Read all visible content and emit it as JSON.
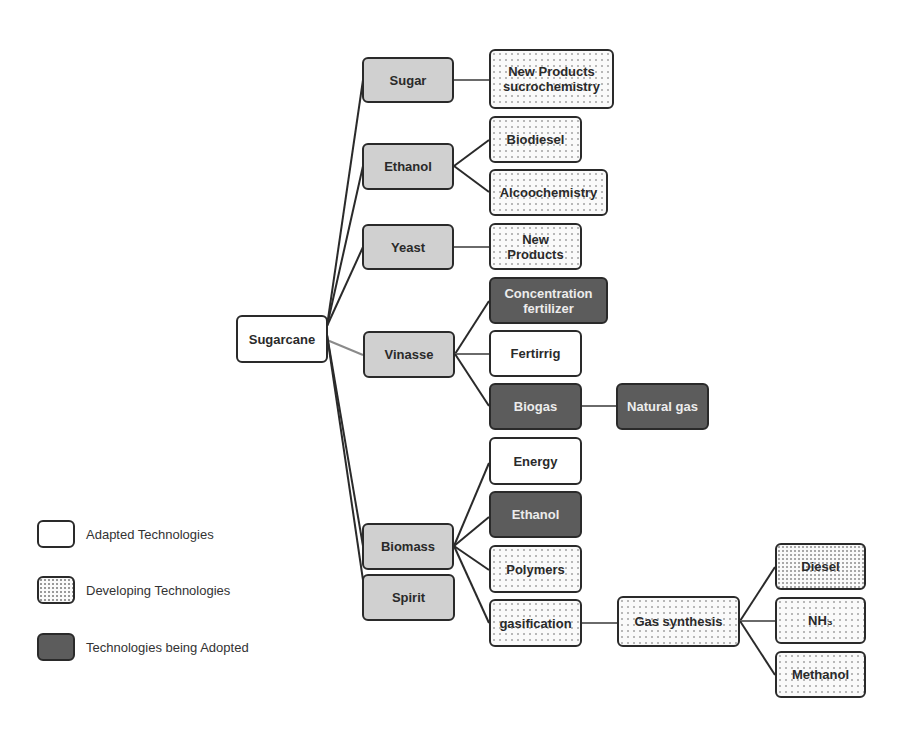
{
  "diagram": {
    "root": {
      "id": "sugarcane",
      "label": "Sugarcane"
    },
    "nodes": [
      {
        "id": "sugarcane",
        "label": "Sugarcane",
        "type": "adapted",
        "x": 236,
        "y": 315,
        "w": 92,
        "h": 48
      },
      {
        "id": "sugar",
        "label": "Sugar",
        "type": "category",
        "x": 362,
        "y": 57,
        "w": 92,
        "h": 46
      },
      {
        "id": "ethanol",
        "label": "Ethanol",
        "type": "category",
        "x": 362,
        "y": 143,
        "w": 92,
        "h": 47
      },
      {
        "id": "yeast",
        "label": "Yeast",
        "type": "category",
        "x": 362,
        "y": 224,
        "w": 92,
        "h": 46
      },
      {
        "id": "vinasse",
        "label": "Vinasse",
        "type": "category",
        "x": 363,
        "y": 331,
        "w": 92,
        "h": 47
      },
      {
        "id": "biomass",
        "label": "Biomass",
        "type": "category",
        "x": 362,
        "y": 523,
        "w": 92,
        "h": 47
      },
      {
        "id": "spirit",
        "label": "Spirit",
        "type": "category",
        "x": 362,
        "y": 574,
        "w": 93,
        "h": 47
      },
      {
        "id": "new-products-sucrochemistry",
        "label": "New Products\nsucrochemistry",
        "type": "developing",
        "x": 489,
        "y": 49,
        "w": 125,
        "h": 60
      },
      {
        "id": "biodiesel",
        "label": "Biodiesel",
        "type": "developing",
        "x": 489,
        "y": 116,
        "w": 93,
        "h": 47
      },
      {
        "id": "alcoochemistry",
        "label": "Alcoochemistry",
        "type": "developing",
        "x": 489,
        "y": 169,
        "w": 119,
        "h": 47
      },
      {
        "id": "new-products",
        "label": "New\nProducts",
        "type": "developing",
        "x": 489,
        "y": 223,
        "w": 93,
        "h": 47
      },
      {
        "id": "concentration-fertilizer",
        "label": "Concentration\nfertilizer",
        "type": "adopting",
        "x": 489,
        "y": 277,
        "w": 119,
        "h": 47
      },
      {
        "id": "fertirrig",
        "label": "Fertirrig",
        "type": "adapted",
        "x": 489,
        "y": 330,
        "w": 93,
        "h": 47
      },
      {
        "id": "biogas",
        "label": "Biogas",
        "type": "adopting",
        "x": 489,
        "y": 383,
        "w": 93,
        "h": 47
      },
      {
        "id": "natural-gas",
        "label": "Natural gas",
        "type": "adopting",
        "x": 616,
        "y": 383,
        "w": 93,
        "h": 47
      },
      {
        "id": "energy",
        "label": "Energy",
        "type": "adapted",
        "x": 489,
        "y": 437,
        "w": 93,
        "h": 48
      },
      {
        "id": "ethanol-biomass",
        "label": "Ethanol",
        "type": "adopting",
        "x": 489,
        "y": 491,
        "w": 93,
        "h": 47
      },
      {
        "id": "polymers",
        "label": "Polymers",
        "type": "developing",
        "x": 489,
        "y": 545,
        "w": 93,
        "h": 48
      },
      {
        "id": "gasification",
        "label": "gasification",
        "type": "developing",
        "x": 489,
        "y": 599,
        "w": 93,
        "h": 48
      },
      {
        "id": "gas-synthesis",
        "label": "Gas synthesis",
        "type": "developing",
        "x": 617,
        "y": 596,
        "w": 123,
        "h": 51
      },
      {
        "id": "diesel",
        "label": "Diesel",
        "type": "developing dense",
        "x": 775,
        "y": 543,
        "w": 91,
        "h": 47
      },
      {
        "id": "nh3",
        "label": "NH₃",
        "type": "developing",
        "x": 775,
        "y": 597,
        "w": 91,
        "h": 47
      },
      {
        "id": "methanol",
        "label": "Methanol",
        "type": "developing",
        "x": 775,
        "y": 651,
        "w": 91,
        "h": 47
      }
    ],
    "edges": [
      {
        "from": "sugarcane",
        "to": "sugar",
        "x1": 327,
        "y1": 326,
        "x2": 363,
        "y2": 80,
        "color": "#2a2a2a"
      },
      {
        "from": "sugarcane",
        "to": "ethanol",
        "x1": 327,
        "y1": 326,
        "x2": 363,
        "y2": 166,
        "color": "#2a2a2a"
      },
      {
        "from": "sugarcane",
        "to": "yeast",
        "x1": 327,
        "y1": 326,
        "x2": 363,
        "y2": 247,
        "color": "#2a2a2a"
      },
      {
        "from": "sugarcane",
        "to": "vinasse",
        "x1": 327,
        "y1": 340,
        "x2": 363,
        "y2": 355,
        "color": "#8a8a8a"
      },
      {
        "from": "sugarcane",
        "to": "biomass",
        "x1": 327,
        "y1": 335,
        "x2": 363,
        "y2": 546,
        "color": "#2a2a2a"
      },
      {
        "from": "sugarcane",
        "to": "spirit",
        "x1": 327,
        "y1": 335,
        "x2": 363,
        "y2": 580,
        "color": "#2a2a2a"
      },
      {
        "from": "sugar",
        "to": "new-products-sucrochemistry",
        "x1": 454,
        "y1": 80,
        "x2": 489,
        "y2": 80,
        "color": "#6a6a6a"
      },
      {
        "from": "ethanol",
        "to": "biodiesel",
        "x1": 454,
        "y1": 166,
        "x2": 489,
        "y2": 140,
        "color": "#2a2a2a"
      },
      {
        "from": "ethanol",
        "to": "alcoochemistry",
        "x1": 454,
        "y1": 166,
        "x2": 489,
        "y2": 192,
        "color": "#2a2a2a"
      },
      {
        "from": "yeast",
        "to": "new-products",
        "x1": 454,
        "y1": 247,
        "x2": 489,
        "y2": 247,
        "color": "#6a6a6a"
      },
      {
        "from": "vinasse",
        "to": "concentration-fertilizer",
        "x1": 455,
        "y1": 354,
        "x2": 489,
        "y2": 301,
        "color": "#2a2a2a"
      },
      {
        "from": "vinasse",
        "to": "fertirrig",
        "x1": 455,
        "y1": 354,
        "x2": 489,
        "y2": 354,
        "color": "#6a6a6a"
      },
      {
        "from": "vinasse",
        "to": "biogas",
        "x1": 455,
        "y1": 354,
        "x2": 489,
        "y2": 406,
        "color": "#2a2a2a"
      },
      {
        "from": "biogas",
        "to": "natural-gas",
        "x1": 582,
        "y1": 406,
        "x2": 616,
        "y2": 406,
        "color": "#6a6a6a"
      },
      {
        "from": "biomass",
        "to": "energy",
        "x1": 454,
        "y1": 546,
        "x2": 489,
        "y2": 463,
        "color": "#2a2a2a"
      },
      {
        "from": "biomass",
        "to": "ethanol-biomass",
        "x1": 454,
        "y1": 546,
        "x2": 489,
        "y2": 517,
        "color": "#2a2a2a"
      },
      {
        "from": "biomass",
        "to": "polymers",
        "x1": 454,
        "y1": 546,
        "x2": 489,
        "y2": 570,
        "color": "#2a2a2a"
      },
      {
        "from": "biomass",
        "to": "gasification",
        "x1": 454,
        "y1": 546,
        "x2": 489,
        "y2": 623,
        "color": "#2a2a2a"
      },
      {
        "from": "gasification",
        "to": "gas-synthesis",
        "x1": 582,
        "y1": 623,
        "x2": 617,
        "y2": 623,
        "color": "#6a6a6a"
      },
      {
        "from": "gas-synthesis",
        "to": "diesel",
        "x1": 740,
        "y1": 621,
        "x2": 775,
        "y2": 567,
        "color": "#2a2a2a"
      },
      {
        "from": "gas-synthesis",
        "to": "nh3",
        "x1": 740,
        "y1": 621,
        "x2": 775,
        "y2": 621,
        "color": "#6a6a6a"
      },
      {
        "from": "gas-synthesis",
        "to": "methanol",
        "x1": 740,
        "y1": 621,
        "x2": 775,
        "y2": 675,
        "color": "#2a2a2a"
      }
    ]
  },
  "legend": {
    "items": [
      {
        "type": "adapted",
        "label": "Adapted Technologies"
      },
      {
        "type": "developing",
        "label": "Developing Technologies"
      },
      {
        "type": "adopting",
        "label": "Technologies being Adopted"
      }
    ]
  },
  "colors": {
    "border": "#2a2a2a",
    "category_fill": "#d0d0d0",
    "adopting_fill": "#5c5c5c",
    "adapted_fill": "#ffffff",
    "developing_dots": "#b8b8b8"
  }
}
